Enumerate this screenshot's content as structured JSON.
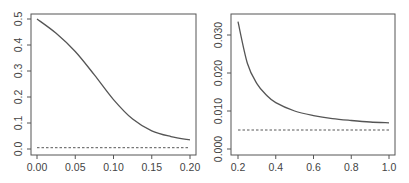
{
  "chart_data": [
    {
      "type": "line",
      "title": "",
      "xlabel": "",
      "ylabel": "",
      "xlim": [
        0.0,
        0.2
      ],
      "ylim": [
        0.0,
        0.5
      ],
      "grid": false,
      "legend": null,
      "x_ticks": [
        "0.00",
        "0.05",
        "0.10",
        "0.15",
        "0.20"
      ],
      "y_ticks": [
        "0.0",
        "0.1",
        "0.2",
        "0.3",
        "0.4",
        "0.5"
      ],
      "series": [
        {
          "name": "curve",
          "style": "solid",
          "x": [
            0.0,
            0.025,
            0.05,
            0.075,
            0.1,
            0.125,
            0.15,
            0.175,
            0.2
          ],
          "y": [
            0.5,
            0.445,
            0.375,
            0.285,
            0.19,
            0.115,
            0.07,
            0.048,
            0.035
          ]
        },
        {
          "name": "reference",
          "style": "dashed",
          "x": [
            0.0,
            0.2
          ],
          "y": [
            0.005,
            0.005
          ]
        }
      ]
    },
    {
      "type": "line",
      "title": "",
      "xlabel": "",
      "ylabel": "",
      "xlim": [
        0.2,
        1.0
      ],
      "ylim": [
        0.0,
        0.034
      ],
      "grid": false,
      "legend": null,
      "x_ticks": [
        "0.2",
        "0.4",
        "0.6",
        "0.8",
        "1.0"
      ],
      "y_ticks": [
        "0.000",
        "0.010",
        "0.020",
        "0.030"
      ],
      "series": [
        {
          "name": "curve",
          "style": "solid",
          "x": [
            0.2,
            0.25,
            0.3,
            0.35,
            0.4,
            0.5,
            0.6,
            0.7,
            0.8,
            0.9,
            1.0
          ],
          "y": [
            0.0335,
            0.0225,
            0.0172,
            0.0142,
            0.0122,
            0.01,
            0.0088,
            0.008,
            0.0075,
            0.0071,
            0.0069
          ]
        },
        {
          "name": "reference",
          "style": "dashed",
          "x": [
            0.2,
            1.0
          ],
          "y": [
            0.005,
            0.005
          ]
        }
      ]
    }
  ]
}
